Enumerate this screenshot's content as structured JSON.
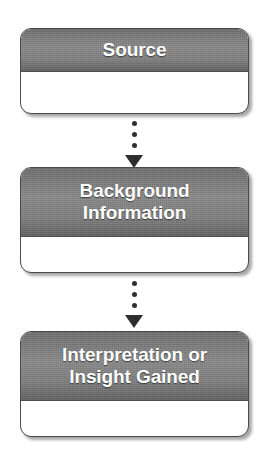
{
  "diagram": {
    "background_color": "#ffffff",
    "header_gradient_top": "#6f6f6f",
    "header_gradient_mid": "#8a8a8a",
    "header_gradient_bottom": "#616161",
    "header_text_color": "#ffffff",
    "body_color": "#ffffff",
    "border_color": "#4a4a4a",
    "connector_color": "#2e2e2e",
    "nodes": [
      {
        "id": "source",
        "label": "Source"
      },
      {
        "id": "background",
        "label": "Background\nInformation"
      },
      {
        "id": "interpretation",
        "label": "Interpretation or\nInsight Gained"
      }
    ],
    "connectors": [
      {
        "id": "connector-1",
        "from": "source",
        "to": "background",
        "style": "dotted",
        "arrow": "down",
        "dots": 3
      },
      {
        "id": "connector-2",
        "from": "background",
        "to": "interpretation",
        "style": "dotted",
        "arrow": "down",
        "dots": 3
      }
    ]
  }
}
